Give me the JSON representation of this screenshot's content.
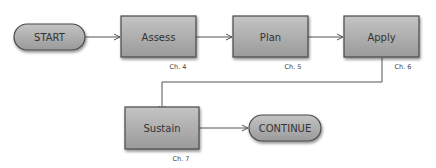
{
  "diagram": {
    "nodes": [
      {
        "id": "start",
        "label": "START",
        "shape": "terminal"
      },
      {
        "id": "assess",
        "label": "Assess",
        "shape": "process",
        "chapter": "Ch. 4"
      },
      {
        "id": "plan",
        "label": "Plan",
        "shape": "process",
        "chapter": "Ch. 5"
      },
      {
        "id": "apply",
        "label": "Apply",
        "shape": "process",
        "chapter": "Ch. 6"
      },
      {
        "id": "sustain",
        "label": "Sustain",
        "shape": "process",
        "chapter": "Ch. 7"
      },
      {
        "id": "continue",
        "label": "CONTINUE",
        "shape": "terminal"
      }
    ],
    "edges": [
      {
        "from": "start",
        "to": "assess"
      },
      {
        "from": "assess",
        "to": "plan"
      },
      {
        "from": "plan",
        "to": "apply"
      },
      {
        "from": "apply",
        "to": "sustain"
      },
      {
        "from": "sustain",
        "to": "continue"
      }
    ],
    "colors": {
      "fill": "#a6a6a6",
      "stroke": "#4a4a4a",
      "line": "#555555"
    }
  }
}
